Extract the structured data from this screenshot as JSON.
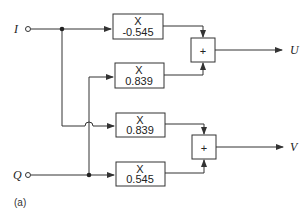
{
  "inputs": {
    "i": {
      "label": "I"
    },
    "q": {
      "label": "Q"
    }
  },
  "outputs": {
    "u": {
      "label": "U"
    },
    "v": {
      "label": "V"
    }
  },
  "multipliers": [
    {
      "op": "X",
      "coef": "-0.545"
    },
    {
      "op": "X",
      "coef": "0.839"
    },
    {
      "op": "X",
      "coef": "0.839"
    },
    {
      "op": "X",
      "coef": "0.545"
    }
  ],
  "summers": [
    {
      "symbol": "+"
    },
    {
      "symbol": "+"
    }
  ],
  "caption": "(a)",
  "colors": {
    "line": "#333333",
    "background": "#ffffff"
  }
}
